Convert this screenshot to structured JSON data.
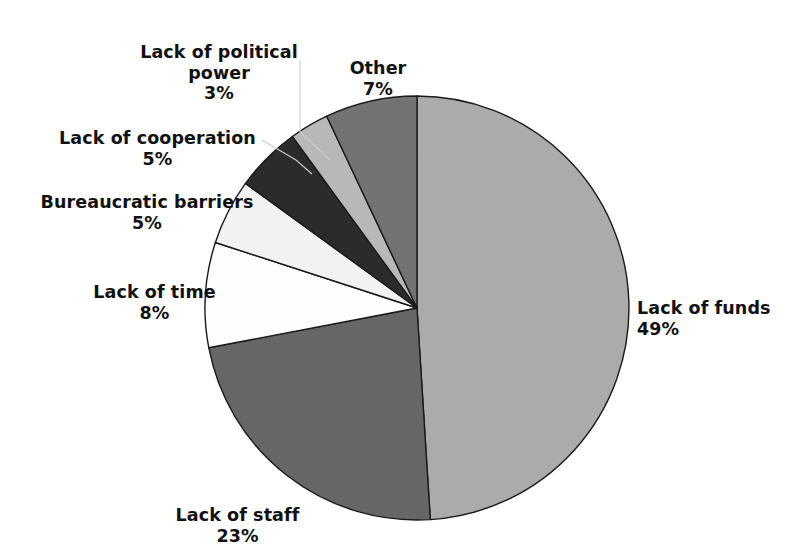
{
  "chart_data": {
    "type": "pie",
    "title": "",
    "subtitle": "",
    "xlabel": "",
    "ylabel": "",
    "legend_position": "none",
    "grid": false,
    "units": "percent",
    "total": 100,
    "start_angle_deg": 90,
    "direction": "counterclockwise",
    "categories": [
      "Lack of funds",
      "Lack of staff",
      "Lack of time",
      "Bureaucratic barriers",
      "Lack of cooperation",
      "Lack of political power",
      "Other"
    ],
    "values": [
      49,
      23,
      8,
      5,
      5,
      3,
      7
    ],
    "slices": [
      {
        "label": "Lack of funds",
        "value": 49,
        "value_text": "49%",
        "color": "#ababab",
        "stroke": "#1a1a1a"
      },
      {
        "label": "Lack of staff",
        "value": 23,
        "value_text": "23%",
        "color": "#666666",
        "stroke": "#1a1a1a"
      },
      {
        "label": "Lack of time",
        "value": 8,
        "value_text": "8%",
        "color": "#fdfdfd",
        "stroke": "#1a1a1a"
      },
      {
        "label": "Bureaucratic barriers",
        "value": 5,
        "value_text": "5%",
        "color": "#f2f2f2",
        "stroke": "#1a1a1a"
      },
      {
        "label": "Lack of cooperation",
        "value": 5,
        "value_text": "5%",
        "color": "#2b2b2b",
        "stroke": "#1a1a1a"
      },
      {
        "label": "Lack of political power",
        "value": 3,
        "value_text": "3%",
        "color": "#b8b8b8",
        "stroke": "#1a1a1a"
      },
      {
        "label": "Other",
        "value": 7,
        "value_text": "7%",
        "color": "#737373",
        "stroke": "#1a1a1a"
      }
    ]
  },
  "labels": {
    "political_power": {
      "name": "Lack of political\npower",
      "value": "3%"
    },
    "other": {
      "name": "Other",
      "value": "7%"
    },
    "cooperation": {
      "name": "Lack of cooperation",
      "value": "5%"
    },
    "bureaucratic": {
      "name": "Bureaucratic barriers",
      "value": "5%"
    },
    "time": {
      "name": "Lack of time",
      "value": "8%"
    },
    "staff": {
      "name": "Lack of staff",
      "value": "23%"
    },
    "funds": {
      "name": "Lack of funds",
      "value": "49%"
    }
  },
  "geometry": {
    "center_x": 417,
    "center_y": 308,
    "radius": 212
  },
  "colors": {
    "background": "#ffffff",
    "text": "#111111",
    "slice_outline": "#1a1a1a",
    "leader_line": "#c9c9c9"
  }
}
